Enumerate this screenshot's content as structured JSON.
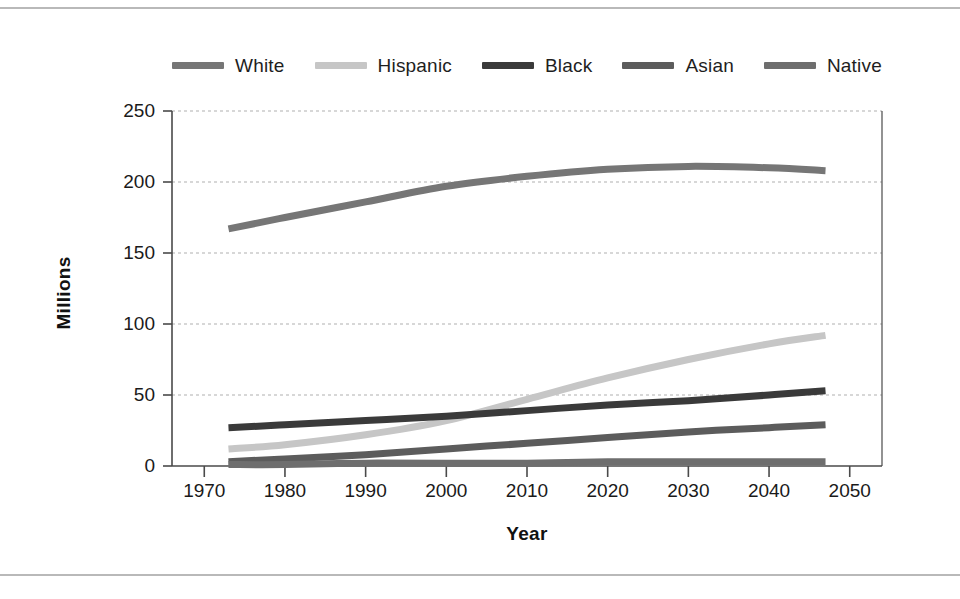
{
  "figure": {
    "background": "#ffffff",
    "rule_color": "#b9b9b9",
    "axis_color": "#4a4a4a",
    "grid_color": "#b0b0b0"
  },
  "axes": {
    "ylabel": "Millions",
    "xlabel": "Year",
    "y_ticks": [
      "0",
      "50",
      "100",
      "150",
      "200",
      "250"
    ],
    "x_ticks": [
      "1970",
      "1980",
      "1990",
      "2000",
      "2010",
      "2020",
      "2030",
      "2040",
      "2050"
    ]
  },
  "legend": {
    "items": [
      {
        "label": "White",
        "color": "#767676"
      },
      {
        "label": "Hispanic",
        "color": "#c6c6c6"
      },
      {
        "label": "Black",
        "color": "#3a3a3a"
      },
      {
        "label": "Asian",
        "color": "#5c5c5c"
      },
      {
        "label": "Native",
        "color": "#6e6e6e"
      }
    ]
  },
  "chart_data": {
    "type": "line",
    "title": "",
    "xlabel": "Year",
    "ylabel": "Millions",
    "xlim": [
      1966,
      2054
    ],
    "ylim": [
      0,
      250
    ],
    "xticks": [
      1970,
      1980,
      1990,
      2000,
      2010,
      2020,
      2030,
      2040,
      2050
    ],
    "yticks": [
      0,
      50,
      100,
      150,
      200,
      250
    ],
    "grid": "horizontal-dotted",
    "legend_position": "top",
    "x": [
      1973,
      1980,
      1990,
      2000,
      2010,
      2020,
      2030,
      2040,
      2047
    ],
    "series": [
      {
        "name": "White",
        "color": "#767676",
        "values": [
          167,
          175,
          186,
          197,
          204,
          209,
          211,
          210,
          208
        ]
      },
      {
        "name": "Hispanic",
        "color": "#c6c6c6",
        "values": [
          12,
          15,
          22,
          32,
          47,
          62,
          75,
          86,
          92
        ]
      },
      {
        "name": "Black",
        "color": "#3a3a3a",
        "values": [
          27,
          29,
          32,
          35,
          39,
          43,
          46,
          50,
          53
        ]
      },
      {
        "name": "Asian",
        "color": "#5c5c5c",
        "values": [
          3,
          5,
          8,
          12,
          16,
          20,
          24,
          27,
          29
        ]
      },
      {
        "name": "Native",
        "color": "#6e6e6e",
        "values": [
          1,
          1,
          2,
          2,
          2,
          3,
          3,
          3,
          3
        ]
      }
    ]
  }
}
